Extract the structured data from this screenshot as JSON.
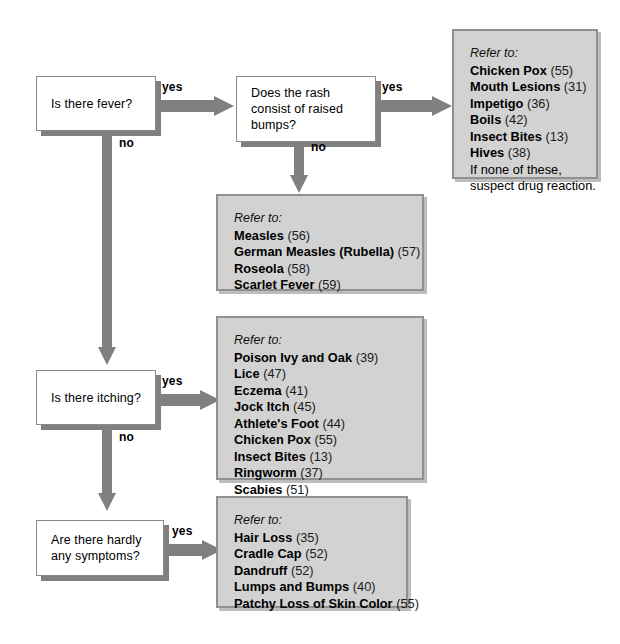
{
  "diagram": {
    "colors": {
      "arrow": "#808080",
      "box_fill": "#d2d2d2",
      "box_border": "#909090",
      "decision_fill": "#ffffff",
      "decision_border": "#8a8a8a",
      "shadow": "#808080",
      "text": "#000000"
    },
    "refer_to_label": "Refer to:",
    "labels": {
      "yes": "yes",
      "no": "no"
    },
    "decisions": [
      {
        "id": "fever",
        "text": "Is there fever?"
      },
      {
        "id": "raised-bumps",
        "text": "Does the rash consist of raised bumps?"
      },
      {
        "id": "itching",
        "text": "Is there itching?"
      },
      {
        "id": "hardly-any-symptoms",
        "text": "Are there hardly any symptoms?"
      }
    ],
    "referrals": [
      {
        "id": "fever-and-bumps",
        "heading": "Refer to:",
        "items": [
          {
            "name": "Chicken Pox",
            "page": "(55)"
          },
          {
            "name": "Mouth Lesions",
            "page": "(31)"
          },
          {
            "name": "Impetigo",
            "page": "(36)"
          },
          {
            "name": "Boils",
            "page": "(42)"
          },
          {
            "name": "Insect Bites",
            "page": "(13)"
          },
          {
            "name": "Hives",
            "page": "(38)"
          }
        ],
        "note_line1": "If none of these,",
        "note_line2": "suspect drug reaction."
      },
      {
        "id": "fever-no-bumps",
        "heading": "Refer to:",
        "items": [
          {
            "name": "Measles",
            "page": "(56)"
          },
          {
            "name": "German Measles (Rubella)",
            "page": "(57)"
          },
          {
            "name": "Roseola",
            "page": "(58)"
          },
          {
            "name": "Scarlet Fever",
            "page": "(59)"
          }
        ]
      },
      {
        "id": "itching",
        "heading": "Refer to:",
        "items": [
          {
            "name": "Poison Ivy and Oak",
            "page": "(39)"
          },
          {
            "name": "Lice",
            "page": "(47)"
          },
          {
            "name": "Eczema",
            "page": "(41)"
          },
          {
            "name": "Jock Itch",
            "page": "(45)"
          },
          {
            "name": "Athlete's Foot",
            "page": "(44)"
          },
          {
            "name": "Chicken Pox",
            "page": "(55)"
          },
          {
            "name": "Insect Bites",
            "page": "(13)"
          },
          {
            "name": "Ringworm",
            "page": "(37)"
          },
          {
            "name": "Scabies",
            "page": "(51)"
          }
        ]
      },
      {
        "id": "hardly-any-symptoms",
        "heading": "Refer to:",
        "items": [
          {
            "name": "Hair Loss",
            "page": "(35)"
          },
          {
            "name": "Cradle Cap",
            "page": "(52)"
          },
          {
            "name": "Dandruff",
            "page": "(52)"
          },
          {
            "name": "Lumps and Bumps",
            "page": "(40)"
          },
          {
            "name": "Patchy Loss of Skin Color",
            "page": "(55)"
          }
        ]
      }
    ]
  }
}
